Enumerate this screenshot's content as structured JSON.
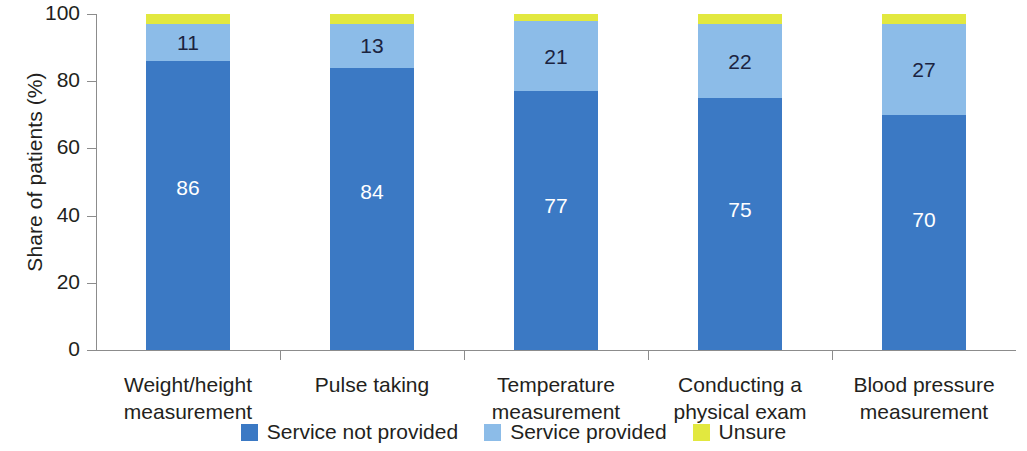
{
  "chart_data": {
    "type": "bar",
    "subtype": "stacked-bar-vertical",
    "title": "",
    "xlabel": "",
    "ylabel": "Share of patients (%)",
    "ylim": [
      0,
      100
    ],
    "yticks": [
      0,
      20,
      40,
      60,
      80,
      100
    ],
    "ytick_labels": [
      "0",
      "20",
      "40",
      "60",
      "80",
      "100"
    ],
    "grid": false,
    "legend_position": "bottom-center",
    "stacked_total": 100,
    "categories": [
      "Weight/height measurement",
      "Pulse taking",
      "Temperature measurement",
      "Conducting a physical exam",
      "Blood pressure measurement"
    ],
    "category_lines": [
      [
        "Weight/height",
        "measurement"
      ],
      [
        "Pulse taking",
        ""
      ],
      [
        "Temperature",
        "measurement"
      ],
      [
        "Conducting a",
        "physical exam"
      ],
      [
        "Blood pressure",
        "measurement"
      ]
    ],
    "series": [
      {
        "name": "Service not provided",
        "color": "#3b79c4",
        "values": [
          86,
          84,
          77,
          75,
          70
        ],
        "labels": [
          "86",
          "84",
          "77",
          "75",
          "70"
        ],
        "labels_shown": true
      },
      {
        "name": "Service provided",
        "color": "#8cbce8",
        "values": [
          11,
          13,
          21,
          22,
          27
        ],
        "labels": [
          "11",
          "13",
          "21",
          "22",
          "27"
        ],
        "labels_shown": true
      },
      {
        "name": "Unsure",
        "color": "#e2e83f",
        "values": [
          3,
          3,
          2,
          3,
          3
        ],
        "labels": [
          "",
          "",
          "",
          "",
          ""
        ],
        "labels_shown": false
      }
    ]
  },
  "axis": {
    "y_title": "Share of patients (%)",
    "y_tick_0": "0",
    "y_tick_1": "20",
    "y_tick_2": "40",
    "y_tick_3": "60",
    "y_tick_4": "80",
    "y_tick_5": "100"
  },
  "bars": [
    {
      "category_line1": "Weight/height",
      "category_line2": "measurement",
      "not_provided": "86",
      "provided": "11"
    },
    {
      "category_line1": "Pulse taking",
      "category_line2": "",
      "not_provided": "84",
      "provided": "13"
    },
    {
      "category_line1": "Temperature",
      "category_line2": "measurement",
      "not_provided": "77",
      "provided": "21"
    },
    {
      "category_line1": "Conducting a",
      "category_line2": "physical exam",
      "not_provided": "75",
      "provided": "22"
    },
    {
      "category_line1": "Blood pressure",
      "category_line2": "measurement",
      "not_provided": "70",
      "provided": "27"
    }
  ],
  "legend": {
    "items": [
      {
        "label": "Service not provided",
        "color": "#3b79c4"
      },
      {
        "label": "Service provided",
        "color": "#8cbce8"
      },
      {
        "label": "Unsure",
        "color": "#e2e83f"
      }
    ]
  },
  "colors": {
    "not_provided": "#3b79c4",
    "provided": "#8cbce8",
    "unsure": "#e2e83f",
    "axis": "#8c8c8c",
    "text": "#231f20",
    "background": "#ffffff"
  }
}
